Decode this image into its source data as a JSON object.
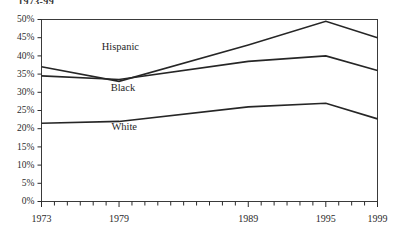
{
  "top_caption": "1973-99",
  "chart_data": {
    "type": "line",
    "title": "",
    "subtitle": "",
    "xlabel": "",
    "ylabel": "",
    "x": [
      1973,
      1979,
      1989,
      1995,
      1999
    ],
    "xlim": [
      1973,
      1999
    ],
    "ylim": [
      0,
      50
    ],
    "ytick_values": [
      0,
      5,
      10,
      15,
      20,
      25,
      30,
      35,
      40,
      45,
      50
    ],
    "ytick_labels": [
      "0%",
      "5%",
      "10%",
      "15%",
      "20%",
      "25%",
      "30%",
      "35%",
      "40%",
      "45%",
      "50%"
    ],
    "xtick_values": [
      1973,
      1979,
      1989,
      1995,
      1999
    ],
    "xtick_labels": [
      "1973",
      "1979",
      "1989",
      "1995",
      "1999"
    ],
    "xtick_minor_values": [
      1973,
      1974,
      1975,
      1976,
      1977,
      1978,
      1979,
      1980,
      1981,
      1982,
      1983,
      1984,
      1985,
      1986,
      1987,
      1988,
      1989,
      1990,
      1991,
      1992,
      1993,
      1994,
      1995,
      1996,
      1997,
      1998,
      1999
    ],
    "grid": false,
    "legend_position": "inline-labels",
    "series": [
      {
        "name": "Hispanic",
        "values": [
          37.0,
          33.0,
          43.0,
          49.5,
          45.0
        ],
        "color": "#262626",
        "label_x": 1979.1,
        "label_y": 41.6
      },
      {
        "name": "Black",
        "values": [
          34.5,
          33.5,
          38.5,
          40.0,
          36.0
        ],
        "color": "#262626",
        "label_x": 1979.3,
        "label_y": 30.4
      },
      {
        "name": "White",
        "values": [
          21.5,
          22.0,
          26.0,
          27.0,
          22.7
        ],
        "color": "#262626",
        "label_x": 1979.4,
        "label_y": 19.6
      }
    ]
  }
}
